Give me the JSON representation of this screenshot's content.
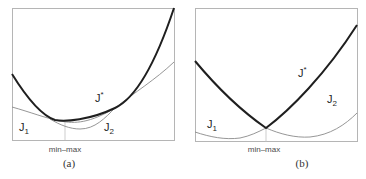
{
  "panels": [
    {
      "id": "a",
      "caption": "(a)",
      "tick_label": "min–max",
      "labels": {
        "J1": "J",
        "J1_sub": "1",
        "J2": "J",
        "J2_sub": "2",
        "Jstar": "J",
        "Jstar_sup": "*"
      },
      "description": "J1 and J2 overlap; min-max of J* = max(J1,J2) occurs at the minimum of J1"
    },
    {
      "id": "b",
      "caption": "(b)",
      "tick_label": "min–max",
      "labels": {
        "J1": "J",
        "J1_sub": "1",
        "J2": "J",
        "J2_sub": "2",
        "Jstar": "J",
        "Jstar_sup": "*"
      },
      "description": "J1 and J2 cross; min-max of J* = max(J1,J2) occurs at the crossing point"
    }
  ],
  "colors": {
    "thick_curve": "#1f1f1f",
    "thin_curve": "#8a8a8a",
    "frame": "#b5b5b5"
  }
}
